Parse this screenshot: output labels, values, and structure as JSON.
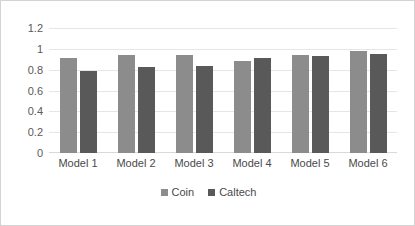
{
  "chart_data": {
    "type": "bar",
    "title": "",
    "subtitle": "",
    "xlabel": "",
    "ylabel": "",
    "categories": [
      "Model 1",
      "Model 2",
      "Model 3",
      "Model 4",
      "Model 5",
      "Model 6"
    ],
    "series": [
      {
        "name": "Coin",
        "color": "#8c8c8c",
        "values": [
          0.91,
          0.94,
          0.94,
          0.88,
          0.94,
          0.98
        ]
      },
      {
        "name": "Caltech",
        "color": "#595959",
        "values": [
          0.79,
          0.83,
          0.84,
          0.91,
          0.93,
          0.95
        ]
      }
    ],
    "ylim": [
      0,
      1.2
    ],
    "ytick_labels": [
      "1.2",
      "1",
      "0.8",
      "0.6",
      "0.4",
      "0.2",
      "0"
    ],
    "ytick_values": [
      1.2,
      1,
      0.8,
      0.6,
      0.4,
      0.2,
      0
    ],
    "grid": true,
    "grid_axis": "y",
    "legend_position": "bottom",
    "annotations": []
  },
  "legend": {
    "entries": [
      {
        "label": "Coin",
        "swatch": "coin-swatch"
      },
      {
        "label": "Caltech",
        "swatch": "caltech-swatch"
      }
    ]
  },
  "colors": {
    "coin": "#8c8c8c",
    "caltech": "#595959",
    "gridline": "#e6e6e6",
    "border": "#d3d3d3",
    "background": "#ffffff",
    "tick_text": "#5a5a5a"
  }
}
